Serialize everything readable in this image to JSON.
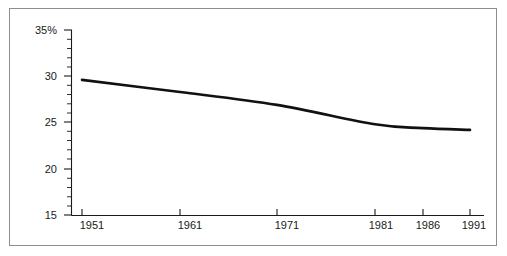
{
  "chart_data": {
    "type": "line",
    "title": "",
    "subtitle": "",
    "xlabel": "",
    "ylabel": "",
    "x": [
      1951,
      1961,
      1971,
      1981,
      1986,
      1991
    ],
    "series": [
      {
        "name": "percentage",
        "values": [
          29.6,
          28.3,
          26.9,
          24.8,
          24.4,
          24.2
        ]
      }
    ],
    "x_tick_labels": [
      "1951",
      "1961",
      "1971",
      "1981",
      "1986",
      "1991"
    ],
    "y_tick_labels": [
      "35%",
      "30",
      "25",
      "20",
      "15"
    ],
    "y_tick_values": [
      35,
      30,
      25,
      20,
      15
    ],
    "y_minor_step": 1,
    "ylim": [
      15,
      35
    ],
    "xlim": [
      1951,
      1991
    ],
    "grid": false,
    "legend": false,
    "legend_position": "none",
    "unit": "%",
    "line_color": "#111111",
    "axis_color": "#1a1a1a",
    "frame_color": "#8e8e8e",
    "background_color": "#ffffff",
    "x_axis_scale_note": "irregular: decade spacing 1951-1981, five-year spacing 1981-1991"
  }
}
